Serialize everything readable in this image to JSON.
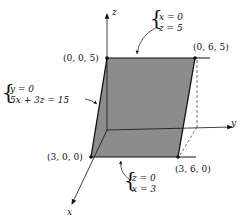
{
  "axes": {
    "x": "x",
    "y": "y",
    "z": "z"
  },
  "points": {
    "p005": "(0, 0, 5)",
    "p065": "(0, 6, 5)",
    "p300": "(3, 0, 0)",
    "p360": "(3, 6, 0)"
  },
  "annotations": {
    "top_edge": {
      "line1": "x = 0",
      "line2": "z = 5"
    },
    "left_edge": {
      "line1": "y = 0",
      "line2": "5x + 3z = 15"
    },
    "bottom_edge": {
      "line1": "z = 0",
      "line2": "x = 3"
    }
  },
  "colors": {
    "plane_fill": "#8c8c8c",
    "line": "#111111"
  }
}
